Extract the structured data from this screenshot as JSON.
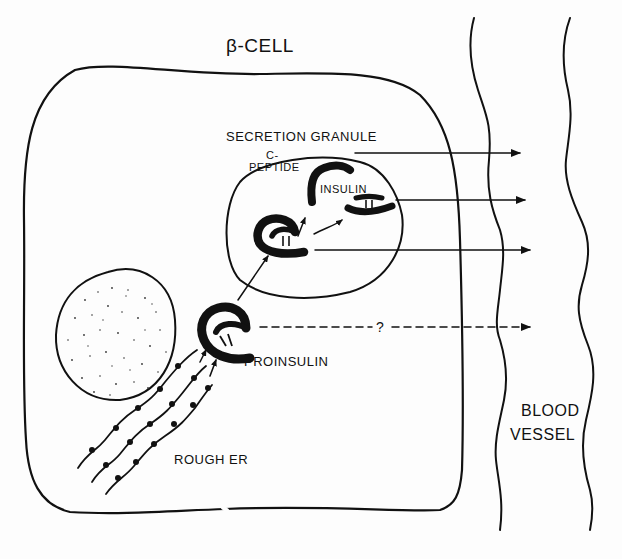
{
  "diagram": {
    "title": "β-CELL",
    "labels": {
      "secretion_granule": "SECRETION GRANULE",
      "c_peptide_line1": "C-",
      "c_peptide_line2": "PEPTIDE",
      "insulin": "INSULIN",
      "proinsulin": "PROINSULIN",
      "rough_er": "ROUGH ER",
      "blood_line1": "BLOOD",
      "blood_line2": "VESSEL",
      "unknown_path": "?"
    },
    "colors": {
      "ink": "#111111",
      "background": "#fdfdfd"
    },
    "structures": [
      "beta-cell membrane",
      "nucleus",
      "rough ER",
      "proinsulin",
      "secretion granule",
      "insulin",
      "C-peptide",
      "blood vessel"
    ],
    "pathways": [
      {
        "from": "rough ER",
        "to": "proinsulin",
        "style": "solid"
      },
      {
        "from": "proinsulin",
        "to": "secretion granule",
        "style": "solid"
      },
      {
        "from": "proinsulin (in granule)",
        "to": "C-peptide",
        "style": "solid"
      },
      {
        "from": "proinsulin (in granule)",
        "to": "insulin",
        "style": "solid"
      },
      {
        "from": "C-peptide",
        "to": "blood vessel",
        "style": "solid"
      },
      {
        "from": "insulin",
        "to": "blood vessel",
        "style": "solid"
      },
      {
        "from": "granule proinsulin",
        "to": "blood vessel",
        "style": "solid"
      },
      {
        "from": "proinsulin",
        "to": "blood vessel",
        "style": "dashed",
        "label": "?"
      }
    ]
  }
}
